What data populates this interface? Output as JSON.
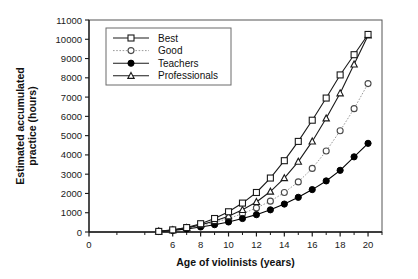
{
  "chart_data": {
    "type": "line",
    "title": "",
    "xlabel": "Age of violinists (years)",
    "ylabel": "Estimated accumulated practice (hours)",
    "ylabel_line1": "Estimated accumulated",
    "ylabel_line2": "practice (hours)",
    "xlim": [
      0,
      21
    ],
    "ylim": [
      0,
      11000
    ],
    "grid": false,
    "legend_position": "top-left",
    "xticks": [
      0,
      6,
      8,
      10,
      12,
      14,
      16,
      18,
      20
    ],
    "xtick_labels": [
      "0",
      "6",
      "8",
      "10",
      "12",
      "14",
      "16",
      "18",
      "20"
    ],
    "xticks_minor": [
      2,
      4,
      5,
      7,
      9,
      11,
      13,
      15,
      17,
      19,
      21
    ],
    "yticks": [
      0,
      1000,
      2000,
      3000,
      4000,
      5000,
      6000,
      7000,
      8000,
      9000,
      10000,
      11000
    ],
    "ytick_labels": [
      "0",
      "1000",
      "2000",
      "3000",
      "4000",
      "5000",
      "6000",
      "7000",
      "8000",
      "9000",
      "10000",
      "11000"
    ],
    "x": [
      5,
      6,
      7,
      8,
      9,
      10,
      11,
      12,
      13,
      14,
      15,
      16,
      17,
      18,
      19,
      20
    ],
    "series": [
      {
        "name": "Best",
        "marker": "open-square",
        "linestyle": "solid",
        "color": "#1a1a1a",
        "values": [
          30,
          110,
          230,
          430,
          700,
          1050,
          1500,
          2050,
          2800,
          3700,
          4700,
          5800,
          6950,
          8150,
          9200,
          10250
        ]
      },
      {
        "name": "Good",
        "marker": "open-circle",
        "linestyle": "dotted",
        "color": "#1a1a1a",
        "values": [
          30,
          100,
          200,
          330,
          500,
          700,
          950,
          1250,
          1600,
          2050,
          2600,
          3300,
          4200,
          5250,
          6400,
          7700
        ]
      },
      {
        "name": "Teachers",
        "marker": "filled-circle",
        "linestyle": "solid",
        "color": "#000000",
        "values": [
          25,
          80,
          160,
          260,
          380,
          520,
          700,
          900,
          1150,
          1450,
          1800,
          2200,
          2650,
          3200,
          3900,
          4600
        ]
      },
      {
        "name": "Professionals",
        "marker": "open-triangle",
        "linestyle": "solid",
        "color": "#1a1a1a",
        "values": [
          30,
          105,
          215,
          370,
          570,
          820,
          1150,
          1560,
          2100,
          2800,
          3650,
          4700,
          5900,
          7200,
          8700,
          10200
        ]
      }
    ],
    "legend": [
      {
        "label": "Best",
        "marker": "open-square",
        "linestyle": "solid"
      },
      {
        "label": "Good",
        "marker": "open-circle",
        "linestyle": "dotted"
      },
      {
        "label": "Teachers",
        "marker": "filled-circle",
        "linestyle": "solid"
      },
      {
        "label": "Professionals",
        "marker": "open-triangle",
        "linestyle": "solid"
      }
    ],
    "colors": {
      "axis": "#1a1a1a",
      "frame": "#555555",
      "background": "#ffffff",
      "line": "#1a1a1a",
      "dotted_line": "#9a9a9a"
    }
  }
}
